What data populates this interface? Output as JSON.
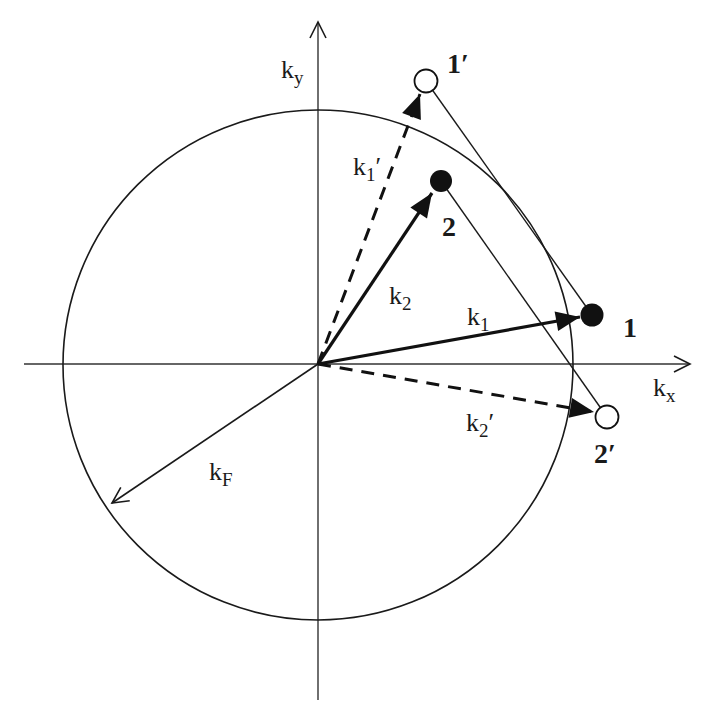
{
  "diagram": {
    "colors": {
      "stroke": "#1a1a1a",
      "background": "#ffffff",
      "filled_point": "#111111",
      "open_point": "#ffffff"
    },
    "axes": {
      "x": {
        "label_base": "k",
        "label_sub": "x"
      },
      "y": {
        "label_base": "k",
        "label_sub": "y"
      }
    },
    "fermi_circle": {
      "vector_label_base": "k",
      "vector_label_sub": "F"
    },
    "vectors": [
      {
        "id": "k1",
        "label_base": "k",
        "label_sub": "1",
        "prime": "",
        "style": "solid",
        "to_point": "1"
      },
      {
        "id": "k2",
        "label_base": "k",
        "label_sub": "2",
        "prime": "",
        "style": "solid",
        "to_point": "2"
      },
      {
        "id": "k1p",
        "label_base": "k",
        "label_sub": "1",
        "prime": "′",
        "style": "dashed",
        "to_point": "1′"
      },
      {
        "id": "k2p",
        "label_base": "k",
        "label_sub": "2",
        "prime": "′",
        "style": "dashed",
        "to_point": "2′"
      }
    ],
    "points": [
      {
        "id": "1",
        "label": "1",
        "state": "filled"
      },
      {
        "id": "2",
        "label": "2",
        "state": "filled"
      },
      {
        "id": "1p",
        "label": "1′",
        "state": "open"
      },
      {
        "id": "2p",
        "label": "2′",
        "state": "open"
      }
    ],
    "connectors": [
      {
        "from": "1′",
        "to": "1"
      },
      {
        "from": "2",
        "to": "2′"
      }
    ]
  }
}
